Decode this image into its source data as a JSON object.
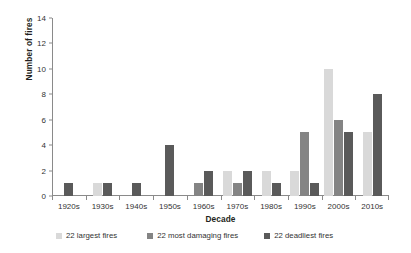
{
  "chart_data": {
    "type": "bar",
    "title": "",
    "xlabel": "Decade",
    "ylabel": "Number of fires",
    "ylim": [
      0,
      14
    ],
    "yticks": [
      0,
      2,
      4,
      6,
      8,
      10,
      12,
      14
    ],
    "grid": false,
    "legend_position": "bottom",
    "categories": [
      "1920s",
      "1930s",
      "1940s",
      "1950s",
      "1960s",
      "1970s",
      "1980s",
      "1990s",
      "2000s",
      "2010s"
    ],
    "series": [
      {
        "name": "22 largest fires",
        "color": "#d9d9d9",
        "values": [
          0,
          1,
          0,
          0,
          0,
          2,
          2,
          2,
          10,
          5
        ]
      },
      {
        "name": "22 most damaging fires",
        "color": "#848484",
        "values": [
          0,
          0,
          0,
          0,
          1,
          1,
          0,
          5,
          6,
          0
        ]
      },
      {
        "name": "22 deadliest fires",
        "color": "#5a5a5a",
        "values": [
          1,
          1,
          1,
          4,
          2,
          2,
          1,
          1,
          5,
          8
        ]
      }
    ]
  }
}
